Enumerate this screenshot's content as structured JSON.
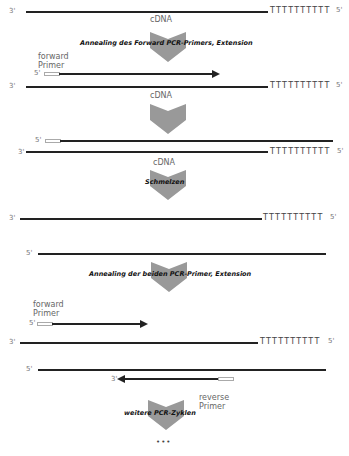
{
  "diagram": {
    "labels": {
      "three_prime": "3'",
      "five_prime": "5'",
      "cdna": "cDNA",
      "poly_t": "TTTTTTTTTT",
      "forward_primer_line1": "forward",
      "forward_primer_line2": "Primer",
      "reverse_primer_line1": "reverse",
      "reverse_primer_line2": "Primer",
      "ellipsis": "•••"
    },
    "steps": [
      {
        "label": "Annealing des Forward PCR-Primers, Extension"
      },
      {
        "label": ""
      },
      {
        "label": "Schmelzen"
      },
      {
        "label": "Annealing der beiden PCR-Primer, Extension"
      },
      {
        "label": "weitere PCR-Zyklen"
      }
    ],
    "colors": {
      "strand": "#222222",
      "arrow_fill": "#999999",
      "primer_outline": "#aaaaaa",
      "label_gray": "#777777"
    }
  }
}
